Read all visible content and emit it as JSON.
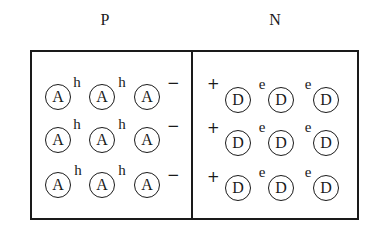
{
  "diagram": {
    "regions": [
      {
        "id": "p",
        "label": "P",
        "ion_symbol": "A",
        "carrier_symbol": "h",
        "charge_symbol": "−"
      },
      {
        "id": "n",
        "label": "N",
        "ion_symbol": "D",
        "carrier_symbol": "e",
        "charge_symbol": "+"
      }
    ],
    "p_region": {
      "label": "P",
      "rows": [
        {
          "ions": [
            "A",
            "A",
            "A"
          ],
          "carriers": [
            "h",
            "h"
          ],
          "charge": "−"
        },
        {
          "ions": [
            "A",
            "A",
            "A"
          ],
          "carriers": [
            "h",
            "h"
          ],
          "charge": "−"
        },
        {
          "ions": [
            "A",
            "A",
            "A"
          ],
          "carriers": [
            "h",
            "h"
          ],
          "charge": "−"
        }
      ]
    },
    "n_region": {
      "label": "N",
      "rows": [
        {
          "charge": "+",
          "ions": [
            "D",
            "D",
            "D"
          ],
          "carriers": [
            "e",
            "e"
          ]
        },
        {
          "charge": "+",
          "ions": [
            "D",
            "D",
            "D"
          ],
          "carriers": [
            "e",
            "e"
          ]
        },
        {
          "charge": "+",
          "ions": [
            "D",
            "D",
            "D"
          ],
          "carriers": [
            "e",
            "e"
          ]
        }
      ]
    },
    "colors": {
      "ink": "#1a1a1a",
      "background": "#ffffff"
    }
  }
}
